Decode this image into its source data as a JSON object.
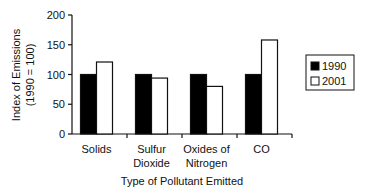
{
  "chart_data": {
    "type": "bar",
    "title": "",
    "xlabel": "Type of Pollutant Emitted",
    "ylabel": [
      "Index of Emissions",
      "(1990 = 100)"
    ],
    "ylim": [
      0,
      200
    ],
    "yticks": [
      0,
      50,
      100,
      150,
      200
    ],
    "grid": false,
    "legend_position": "right",
    "categories": [
      [
        "Solids"
      ],
      [
        "Sulfur",
        "Dioxide"
      ],
      [
        "Oxides of",
        "Nitrogen"
      ],
      [
        "CO"
      ]
    ],
    "category_names": [
      "Solids",
      "Sulfur Dioxide",
      "Oxides of Nitrogen",
      "CO"
    ],
    "series": [
      {
        "name": "1990",
        "fill": "#000000",
        "values": [
          100,
          100,
          100,
          100
        ]
      },
      {
        "name": "2001",
        "fill": "#ffffff",
        "values": [
          121,
          94,
          80,
          158
        ]
      }
    ]
  },
  "colors": {
    "axis": "#111111",
    "bar_outline": "#111111"
  }
}
